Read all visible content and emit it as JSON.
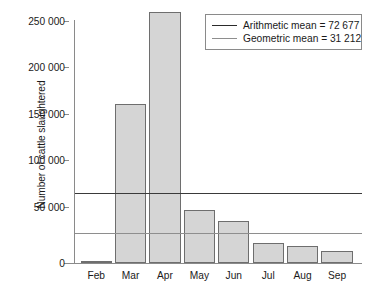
{
  "chart_data": {
    "type": "bar",
    "title": "",
    "xlabel": "",
    "ylabel": "Number of cattle slaughtered",
    "categories": [
      "Feb",
      "Mar",
      "Apr",
      "May",
      "Jun",
      "Jul",
      "Aug",
      "Sep"
    ],
    "values": [
      2000,
      164000,
      259000,
      55000,
      43000,
      21000,
      18000,
      12000
    ],
    "ylim": [
      0,
      265000
    ],
    "yticks": [
      0,
      50000,
      100000,
      150000,
      200000,
      250000
    ],
    "ytick_labels": [
      "0",
      "50 000",
      "100 000",
      "150 000",
      "200 000",
      "250 000"
    ],
    "grid": false,
    "legend_position": "top-right",
    "reference_lines": [
      {
        "name": "Arithmetic mean",
        "value": 72677,
        "label": "Arithmetic mean = 72 677",
        "color": "#2b2b2b"
      },
      {
        "name": "Geometric mean",
        "value": 31212,
        "label": "Geometric mean = 31 212",
        "color": "#8e8e8e"
      }
    ],
    "series": [
      {
        "name": "Number of cattle slaughtered",
        "values": [
          2000,
          164000,
          259000,
          55000,
          43000,
          21000,
          18000,
          12000
        ]
      }
    ],
    "bar_color": "#d5d5d5",
    "bar_edge_color": "#6e6e6e",
    "axis_color": "#8a8a8a"
  },
  "axis": {
    "ylabel": "Number of cattle slaughtered",
    "ytick_labels": [
      "250 000",
      "200 000",
      "150 000",
      "100 000",
      "50 000",
      "0"
    ],
    "xtick_labels": [
      "Feb",
      "Mar",
      "Apr",
      "May",
      "Jun",
      "Jul",
      "Aug",
      "Sep"
    ]
  },
  "legend": {
    "items": [
      {
        "label": "Arithmetic mean = 72 677",
        "style": "arith"
      },
      {
        "label": "Geometric mean = 31 212",
        "style": "geom"
      }
    ]
  },
  "caption": {
    "text": ""
  }
}
